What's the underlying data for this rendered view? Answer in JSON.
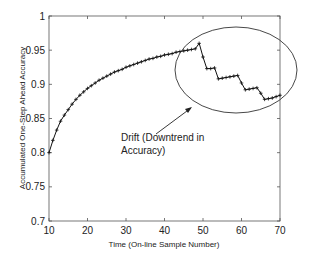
{
  "chart_data": {
    "type": "line",
    "title": "",
    "xlabel": "Time (On-line Sample Number)",
    "ylabel": "Accumulated One-Step Ahead Accuracy",
    "xlim": [
      10,
      70
    ],
    "ylim": [
      0.7,
      1
    ],
    "xticks": [
      10,
      20,
      30,
      40,
      50,
      60,
      70
    ],
    "yticks": [
      0.7,
      0.75,
      0.8,
      0.85,
      0.9,
      0.95,
      1
    ],
    "ytick_labels": [
      "0.7",
      "0.75",
      "0.8",
      "0.85",
      "0.9",
      "0.95",
      "1"
    ],
    "grid": false,
    "marker": "+",
    "series": [
      {
        "name": "Accumulated One-Step Ahead Accuracy",
        "x": [
          10,
          11,
          12,
          13,
          14,
          15,
          16,
          17,
          18,
          19,
          20,
          21,
          22,
          23,
          24,
          25,
          26,
          27,
          28,
          29,
          30,
          31,
          32,
          33,
          34,
          35,
          36,
          37,
          38,
          39,
          40,
          41,
          42,
          43,
          44,
          45,
          46,
          47,
          48,
          49,
          50,
          51,
          52,
          53,
          54,
          55,
          56,
          57,
          58,
          59,
          60,
          61,
          62,
          63,
          64,
          65,
          66,
          67,
          68,
          69,
          70
        ],
        "y": [
          0.8,
          0.818,
          0.833,
          0.846,
          0.855,
          0.863,
          0.871,
          0.878,
          0.884,
          0.889,
          0.894,
          0.898,
          0.902,
          0.906,
          0.909,
          0.912,
          0.915,
          0.918,
          0.92,
          0.922,
          0.925,
          0.927,
          0.929,
          0.931,
          0.933,
          0.935,
          0.937,
          0.938,
          0.94,
          0.941,
          0.943,
          0.944,
          0.945,
          0.947,
          0.948,
          0.949,
          0.95,
          0.951,
          0.952,
          0.96,
          0.94,
          0.923,
          0.923,
          0.924,
          0.908,
          0.909,
          0.91,
          0.911,
          0.912,
          0.913,
          0.902,
          0.892,
          0.893,
          0.894,
          0.895,
          0.887,
          0.878,
          0.879,
          0.88,
          0.882,
          0.884
        ]
      }
    ],
    "annotations": [
      {
        "text_lines": [
          "Drift (Downtrend in",
          "Accuracy)"
        ],
        "type": "arrow-to-ellipse",
        "ellipse_center": [
          59,
          0.925
        ],
        "ellipse_span_x": [
          43,
          75
        ],
        "ellipse_span_y": [
          0.865,
          0.99
        ]
      }
    ]
  }
}
